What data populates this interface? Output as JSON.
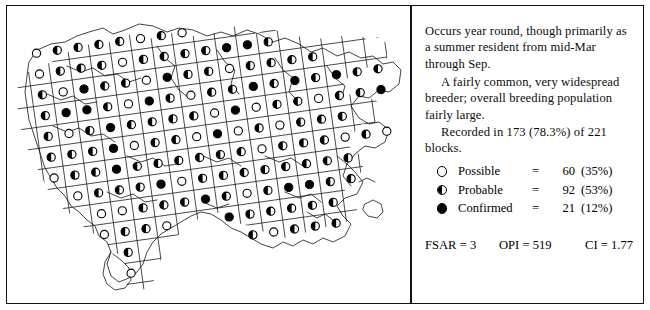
{
  "panel": {
    "paragraphs": [
      "Occurs year round, though primarily as a summer resident from mid-Mar through Sep.",
      "A fairly common, very widespread breeder; overall breeding population fairly large.",
      "Recorded in 173 (78.3%) of 221 blocks."
    ]
  },
  "legend": {
    "rows": [
      {
        "symbol": "open-circle",
        "label": "Possible",
        "equals": "=",
        "count": "60",
        "percent": "(35%)"
      },
      {
        "symbol": "half-circle",
        "label": "Probable",
        "equals": "=",
        "count": "92",
        "percent": "(53%)"
      },
      {
        "symbol": "filled-circle",
        "label": "Confirmed",
        "equals": "=",
        "count": "21",
        "percent": "(12%)"
      }
    ]
  },
  "stats": {
    "fsar": "FSAR = 3",
    "opi": "OPI = 519",
    "ci": "CI = 1.77"
  },
  "map": {
    "title": "breeding-distribution-atlas-map",
    "colors": {
      "ink": "#111111",
      "coastline": "#222222",
      "grid": "#1a1a1a",
      "paper": "#ffffff"
    },
    "grid_rotation_deg": -8,
    "cell_size_px": 21,
    "summary": {
      "blocks_total": "221",
      "blocks_recorded": "173",
      "possible": "60",
      "probable": "92",
      "confirmed": "21"
    },
    "chart_data": {
      "type": "map",
      "title": "Breeding distribution by atlas block",
      "categories": [
        "Possible",
        "Probable",
        "Confirmed"
      ],
      "values": [
        60,
        92,
        21
      ],
      "percents": [
        35,
        53,
        12
      ],
      "total_blocks": 221,
      "recorded_blocks": 173,
      "recorded_percent": 78.3
    }
  }
}
